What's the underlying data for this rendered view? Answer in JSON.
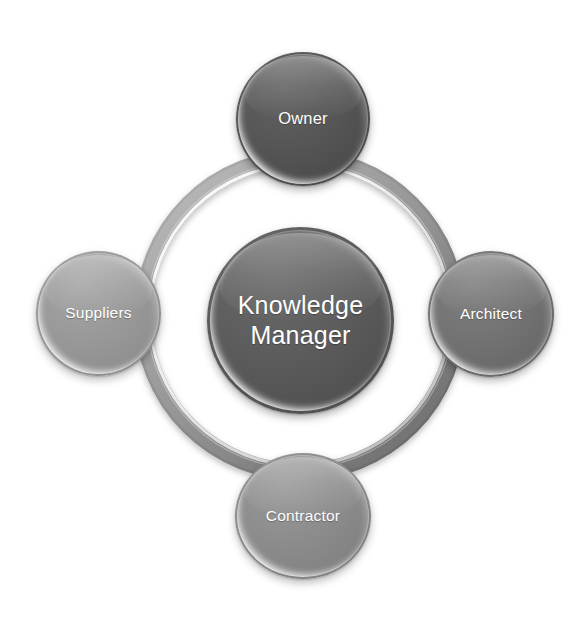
{
  "diagram": {
    "type": "radial-cycle",
    "background_color": "#ffffff",
    "center": {
      "id": "knowledge-manager",
      "label": "Knowledge\nManager",
      "label_line1": "Knowledge",
      "label_line2": "Manager",
      "fill_color": "#585858",
      "text_color": "#ffffff"
    },
    "ring": {
      "name": "connector-ring",
      "shape": "torus",
      "fill_color": "#8f8f8f",
      "highlight_color": "#ffffff",
      "shadow_color": "#5e5e5e"
    },
    "satellites": [
      {
        "id": "owner",
        "label": "Owner",
        "position": "top",
        "fill_color": "#525252",
        "text_color": "#ffffff"
      },
      {
        "id": "architect",
        "label": "Architect",
        "position": "right",
        "fill_color": "#6f6f6f",
        "text_color": "#ffffff"
      },
      {
        "id": "contractor",
        "label": "Contractor",
        "position": "bottom",
        "fill_color": "#8b8b8b",
        "text_color": "#ffffff"
      },
      {
        "id": "suppliers",
        "label": "Suppliers",
        "position": "left",
        "fill_color": "#9b9b9b",
        "text_color": "#ffffff"
      }
    ]
  }
}
